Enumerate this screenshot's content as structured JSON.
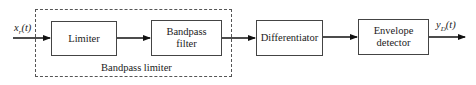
{
  "diagram": {
    "type": "block-diagram",
    "input_signal": {
      "base": "x",
      "sub": "r",
      "arg": "(t)"
    },
    "output_signal": {
      "base": "y",
      "sub": "D",
      "arg": "(t)"
    },
    "group": {
      "label": "Bandpass limiter",
      "contains": [
        "Limiter",
        "Bandpass filter"
      ]
    },
    "blocks": [
      {
        "id": "limiter",
        "line1": "Limiter",
        "line2": ""
      },
      {
        "id": "bandpass-filter",
        "line1": "Bandpass",
        "line2": "filter"
      },
      {
        "id": "differentiator",
        "line1": "Differentiator",
        "line2": ""
      },
      {
        "id": "envelope-detector",
        "line1": "Envelope",
        "line2": "detector"
      }
    ],
    "flow": [
      "x_r(t)",
      "Limiter",
      "Bandpass filter",
      "Differentiator",
      "Envelope detector",
      "y_D(t)"
    ]
  }
}
